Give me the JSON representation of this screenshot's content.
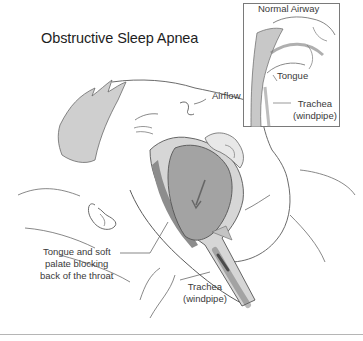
{
  "title": "Obstructive Sleep Apnea",
  "inset": {
    "title": "Normal Airway",
    "labels": {
      "tongue": "Tongue",
      "trachea_line1": "Trachea",
      "trachea_line2": "(windpipe)"
    }
  },
  "labels": {
    "airflow": "Airflow",
    "obstruction_line1": "Tongue and soft",
    "obstruction_line2": "palate blocking",
    "obstruction_line3": "back of the throat",
    "trachea_line1": "Trachea",
    "trachea_line2": "(windpipe)"
  },
  "colors": {
    "line": "#555555",
    "tissue_dark": "#8a8a8a",
    "tissue_mid": "#b8b8b8",
    "tissue_light": "#dcdcdc",
    "hair": "#c9c9c9",
    "divider": "#b5b5b5"
  }
}
